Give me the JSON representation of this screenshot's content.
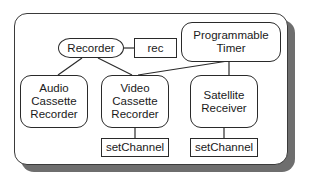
{
  "diagram": {
    "nodes": {
      "recorder": {
        "label": "Recorder",
        "shape": "ellipse"
      },
      "rec": {
        "label": "rec",
        "shape": "rectangle"
      },
      "programmable_timer": {
        "label": "Programmable\nTimer",
        "shape": "rounded-rectangle"
      },
      "audio_cassette_recorder": {
        "label": "Audio\nCassette\nRecorder",
        "shape": "rounded-rectangle"
      },
      "video_cassette_recorder": {
        "label": "Video\nCassette\nRecorder",
        "shape": "rounded-rectangle"
      },
      "satellite_receiver": {
        "label": "Satellite\nReceiver",
        "shape": "rounded-rectangle"
      },
      "vcr_set_channel": {
        "label": "setChannel",
        "shape": "rectangle"
      },
      "sat_set_channel": {
        "label": "setChannel",
        "shape": "rectangle"
      }
    },
    "edges": [
      {
        "from": "recorder",
        "to": "rec"
      },
      {
        "from": "recorder",
        "to": "audio_cassette_recorder"
      },
      {
        "from": "recorder",
        "to": "video_cassette_recorder"
      },
      {
        "from": "programmable_timer",
        "to": "video_cassette_recorder"
      },
      {
        "from": "programmable_timer",
        "to": "satellite_receiver"
      },
      {
        "from": "video_cassette_recorder",
        "to": "vcr_set_channel"
      },
      {
        "from": "satellite_receiver",
        "to": "sat_set_channel"
      }
    ],
    "colors": {
      "frame_border": "#3a3a3a",
      "shadow": "#6e6e6e",
      "line": "#2a2a2a",
      "background": "#ffffff"
    }
  }
}
